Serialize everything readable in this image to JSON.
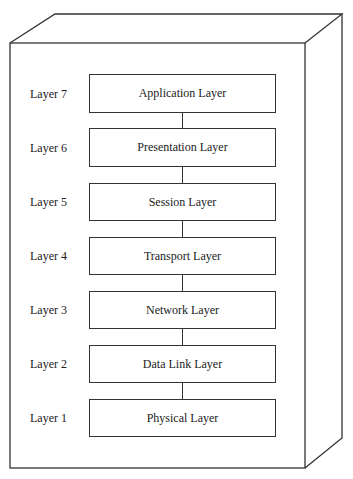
{
  "diagram": {
    "type": "osi-model-stack",
    "layers": [
      {
        "number_label": "Layer 7",
        "name": "Application Layer"
      },
      {
        "number_label": "Layer 6",
        "name": "Presentation Layer"
      },
      {
        "number_label": "Layer 5",
        "name": "Session Layer"
      },
      {
        "number_label": "Layer 4",
        "name": "Transport Layer"
      },
      {
        "number_label": "Layer 3",
        "name": "Network Layer"
      },
      {
        "number_label": "Layer 2",
        "name": "Data Link Layer"
      },
      {
        "number_label": "Layer 1",
        "name": "Physical Layer"
      }
    ],
    "colors": {
      "stroke": "#333333",
      "background": "#ffffff",
      "text": "#222222"
    }
  }
}
